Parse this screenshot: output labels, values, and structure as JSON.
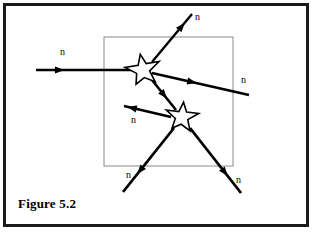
{
  "figure": {
    "caption": "Figure 5.2",
    "title": "Figure 5.2",
    "colors": {
      "frame": "#1a1a1a",
      "inner_box": "#8a8a8a",
      "ray": "#000000",
      "star_outline": "#000000",
      "star_fill": "#ffffff",
      "background": "#ffffff",
      "text": "#000000"
    },
    "inner_box": {
      "name": "reaction-boundary",
      "x": 104,
      "y": 37,
      "width": 129,
      "height": 129
    },
    "stars": [
      {
        "name": "fission-event-upper",
        "cx": 143,
        "cy": 70,
        "r_outer": 17,
        "r_inner": 7.2,
        "rotation": -10
      },
      {
        "name": "fission-event-lower",
        "cx": 182,
        "cy": 117,
        "r_outer": 16,
        "r_inner": 6.8,
        "rotation": 6
      }
    ],
    "rays": [
      {
        "name": "incoming-neutron-ray",
        "x1": 36,
        "y1": 70,
        "x2": 131,
        "y2": 70,
        "arrow_at": 0.3,
        "width": 2.4
      },
      {
        "name": "emitted-neutron-upper-right",
        "x1": 152,
        "y1": 62,
        "x2": 192,
        "y2": 14,
        "arrow_at": 0.82,
        "width": 2.4
      },
      {
        "name": "emitted-neutron-right",
        "x1": 152,
        "y1": 73,
        "x2": 249,
        "y2": 95,
        "arrow_at": 0.46,
        "width": 2.4
      },
      {
        "name": "neutron-between-nuclei",
        "x1": 152,
        "y1": 80,
        "x2": 176,
        "y2": 110,
        "arrow_at": 0.62,
        "width": 2.6
      },
      {
        "name": "emitted-neutron-left",
        "x1": 171,
        "y1": 117,
        "x2": 124,
        "y2": 106,
        "arrow_at": 0.93,
        "width": 2.6
      },
      {
        "name": "emitted-neutron-lower-left",
        "x1": 174,
        "y1": 128,
        "x2": 123,
        "y2": 192,
        "arrow_at": 0.72,
        "width": 2.8
      },
      {
        "name": "emitted-neutron-lower-right",
        "x1": 190,
        "y1": 128,
        "x2": 241,
        "y2": 193,
        "arrow_at": 0.74,
        "width": 2.8
      }
    ],
    "labels": [
      {
        "name": "neutron-label-incoming",
        "text": "n",
        "x": 60,
        "y": 47
      },
      {
        "name": "neutron-label-upper-right",
        "text": "n",
        "x": 195,
        "y": 12
      },
      {
        "name": "neutron-label-right",
        "text": "n",
        "x": 241,
        "y": 75
      },
      {
        "name": "neutron-label-left",
        "text": "n",
        "x": 131,
        "y": 115
      },
      {
        "name": "neutron-label-lower-left",
        "text": "n",
        "x": 126,
        "y": 170
      },
      {
        "name": "neutron-label-lower-right",
        "text": "n",
        "x": 236,
        "y": 175
      }
    ]
  }
}
